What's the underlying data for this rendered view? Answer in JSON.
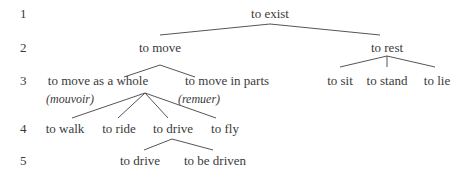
{
  "levels": [
    "1",
    "2",
    "3",
    "4",
    "5"
  ],
  "nodes": {
    "exist": "to exist",
    "move": "to move",
    "rest": "to rest",
    "move_whole": "to move as a whole",
    "move_parts": "to move in parts",
    "sit": "to sit",
    "stand": "to stand",
    "lie": "to lie",
    "walk": "to walk",
    "ride": "to ride",
    "drive": "to drive",
    "fly": "to fly",
    "drive2": "to drive",
    "be_driven": "to be driven"
  },
  "glosses": {
    "move_whole": "(mouvoir)",
    "move_parts": "(remuer)"
  }
}
